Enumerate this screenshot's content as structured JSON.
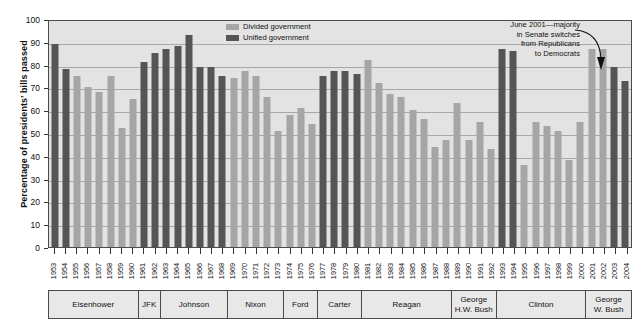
{
  "axis": {
    "y_title": "Percentage of presidents' bills passed",
    "y_ticks": [
      "100",
      "90",
      "80",
      "70",
      "60",
      "50",
      "40",
      "30",
      "20",
      "10",
      "0"
    ]
  },
  "legend": {
    "divided_label": "Divided government",
    "unified_label": "Unified government",
    "divided_color": "#a6a6a6",
    "unified_color": "#555555"
  },
  "annotation": {
    "line1": "June 2001—majority",
    "line2": "in Senate switches",
    "line3": "from Republicans",
    "line4": "to Democrats"
  },
  "presidents": [
    {
      "name": "Eisenhower",
      "years": 8
    },
    {
      "name": "JFK",
      "years": 2
    },
    {
      "name": "Johnson",
      "years": 6
    },
    {
      "name": "Nixon",
      "years": 5
    },
    {
      "name": "Ford",
      "years": 3
    },
    {
      "name": "Carter",
      "years": 4
    },
    {
      "name": "Reagan",
      "years": 8
    },
    {
      "name": "George\nH.W. Bush",
      "years": 4
    },
    {
      "name": "Clinton",
      "years": 8
    },
    {
      "name": "George\nW. Bush",
      "years": 4
    }
  ],
  "chart_data": {
    "type": "bar",
    "title": "",
    "xlabel": "",
    "ylabel": "Percentage of presidents' bills passed",
    "ylim": [
      0,
      100
    ],
    "ytick_step": 10,
    "grid": true,
    "legend_position": "top-center",
    "categories": [
      "1953",
      "1954",
      "1955",
      "1956",
      "1957",
      "1958",
      "1959",
      "1960",
      "1961",
      "1962",
      "1963",
      "1964",
      "1965",
      "1966",
      "1967",
      "1968",
      "1969",
      "1970",
      "1971",
      "1972",
      "1973",
      "1974",
      "1975",
      "1976",
      "1977",
      "1978",
      "1979",
      "1980",
      "1981",
      "1982",
      "1983",
      "1984",
      "1985",
      "1986",
      "1987",
      "1988",
      "1989",
      "1990",
      "1991",
      "1992",
      "1993",
      "1994",
      "1995",
      "1996",
      "1997",
      "1998",
      "1999",
      "2000",
      "2001",
      "2002",
      "2003",
      "2004"
    ],
    "values": [
      89,
      78,
      75,
      70,
      68,
      75,
      52,
      65,
      81,
      85,
      87,
      88,
      93,
      79,
      79,
      75,
      74,
      77,
      75,
      66,
      51,
      58,
      61,
      54,
      75,
      77,
      77,
      76,
      82,
      72,
      67,
      66,
      60,
      56,
      44,
      47,
      63,
      47,
      55,
      43,
      87,
      86,
      36,
      55,
      53,
      51,
      38,
      55,
      87,
      87,
      79,
      73
    ],
    "government": [
      "unified",
      "unified",
      "divided",
      "divided",
      "divided",
      "divided",
      "divided",
      "divided",
      "unified",
      "unified",
      "unified",
      "unified",
      "unified",
      "unified",
      "unified",
      "unified",
      "divided",
      "divided",
      "divided",
      "divided",
      "divided",
      "divided",
      "divided",
      "divided",
      "unified",
      "unified",
      "unified",
      "unified",
      "divided",
      "divided",
      "divided",
      "divided",
      "divided",
      "divided",
      "divided",
      "divided",
      "divided",
      "divided",
      "divided",
      "divided",
      "unified",
      "unified",
      "divided",
      "divided",
      "divided",
      "divided",
      "divided",
      "divided",
      "divided",
      "divided",
      "unified",
      "unified"
    ],
    "series": [
      {
        "name": "Divided government",
        "color": "#a6a6a6"
      },
      {
        "name": "Unified government",
        "color": "#555555"
      }
    ]
  }
}
